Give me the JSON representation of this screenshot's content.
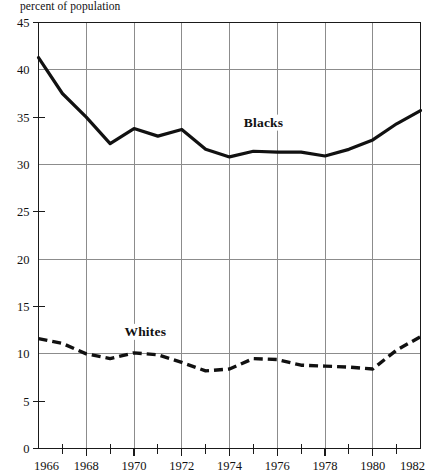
{
  "chart_data": {
    "type": "line",
    "title": "",
    "subtitle": "",
    "axis_note": "percent of population",
    "xlabel": "",
    "ylabel": "percent of population",
    "xlim": [
      1966,
      1982
    ],
    "ylim": [
      0,
      45
    ],
    "grid": true,
    "grid_x_values": [
      1968,
      1970,
      1972,
      1974,
      1976,
      1978,
      1980,
      1982
    ],
    "grid_y_values": [
      10,
      20,
      30,
      40
    ],
    "y_ticks": [
      0,
      5,
      10,
      15,
      20,
      25,
      30,
      35,
      40,
      45
    ],
    "y_tick_labels": [
      "0",
      "5",
      "10",
      "15",
      "20",
      "25",
      "30",
      "35",
      "40",
      "45"
    ],
    "x_ticks": [
      1966,
      1967,
      1968,
      1969,
      1970,
      1971,
      1972,
      1973,
      1974,
      1975,
      1976,
      1977,
      1978,
      1979,
      1980,
      1981,
      1982
    ],
    "x_tick_labels_major": [
      "1966",
      "1968",
      "1970",
      "1972",
      "1974",
      "1976",
      "1978",
      "1980",
      "1982"
    ],
    "x_major_values": [
      1966,
      1968,
      1970,
      1972,
      1974,
      1976,
      1978,
      1980,
      1982
    ],
    "legend_position": "inline-annotation",
    "x": [
      1966,
      1967,
      1968,
      1969,
      1970,
      1971,
      1972,
      1973,
      1974,
      1975,
      1976,
      1977,
      1978,
      1979,
      1980,
      1981,
      1982
    ],
    "series": [
      {
        "name": "Blacks",
        "style": "solid",
        "color": "#111111",
        "label_x": 1974.6,
        "label_y": 34.0,
        "values": [
          41.3,
          37.5,
          35.0,
          32.2,
          33.8,
          33.0,
          33.7,
          31.6,
          30.8,
          31.4,
          31.3,
          31.3,
          30.9,
          31.6,
          32.6,
          34.3,
          35.7
        ]
      },
      {
        "name": "Whites",
        "style": "dashed",
        "color": "#111111",
        "label_x": 1969.6,
        "label_y": 11.9,
        "values": [
          11.6,
          11.1,
          10.0,
          9.5,
          10.1,
          9.9,
          9.1,
          8.2,
          8.4,
          9.5,
          9.4,
          8.8,
          8.7,
          8.6,
          8.4,
          10.4,
          11.8
        ]
      }
    ]
  }
}
